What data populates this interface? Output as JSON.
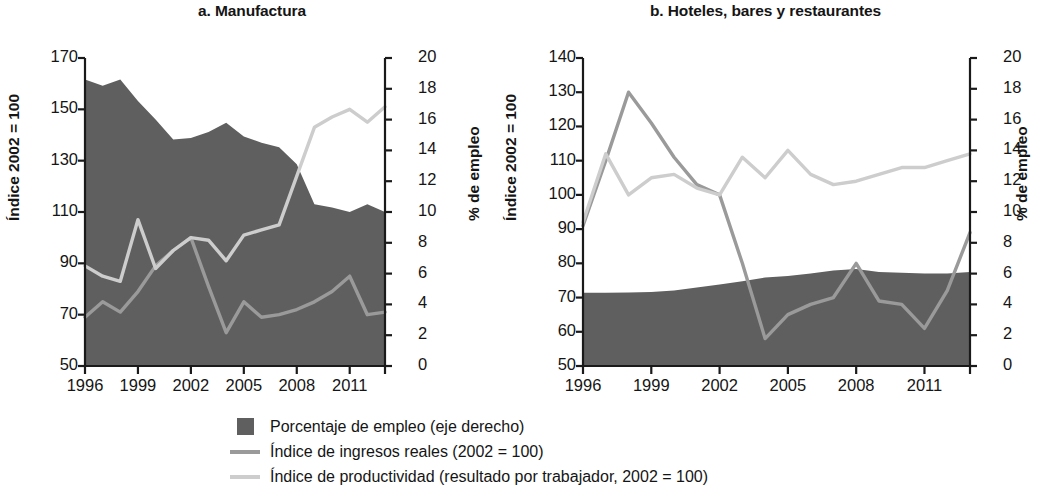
{
  "figure": {
    "panels": [
      {
        "id": "a",
        "title": "a. Manufactura",
        "y_left_label": "Índice 2002 = 100",
        "y_right_label": "% de empleo"
      },
      {
        "id": "b",
        "title": "b. Hoteles, bares y restaurantes",
        "y_left_label": "Índice 2002 = 100",
        "y_right_label": "% de empleo"
      }
    ]
  },
  "legend": {
    "items": [
      {
        "key": "area",
        "symbol": "filled-square",
        "color": "#5f5f5f",
        "label": "Porcentaje de empleo (eje derecho)"
      },
      {
        "key": "income",
        "symbol": "line",
        "color": "#9a9a9a",
        "label": "Índice de ingresos reales (2002 = 100)"
      },
      {
        "key": "prod",
        "symbol": "line",
        "color": "#cdcdcd",
        "label": "Índice de productividad (resultado por trabajador, 2002 = 100)"
      }
    ]
  },
  "chart_data": [
    {
      "id": "a",
      "type": "area",
      "title": "a. Manufactura",
      "xlabel": "",
      "ylabel": "Índice 2002 = 100",
      "y2label": "% de empleo",
      "grid": false,
      "legend_position": "bottom",
      "x": [
        1996,
        1997,
        1998,
        1999,
        2000,
        2001,
        2002,
        2003,
        2004,
        2005,
        2006,
        2007,
        2008,
        2009,
        2010,
        2011,
        2012,
        2013
      ],
      "xticks": [
        1996,
        1999,
        2002,
        2005,
        2008,
        2011
      ],
      "xlim": [
        1996,
        2013
      ],
      "ylim": [
        50,
        170
      ],
      "yticks": [
        50,
        70,
        90,
        110,
        130,
        150,
        170
      ],
      "y2lim": [
        0,
        20
      ],
      "y2ticks": [
        0,
        2,
        4,
        6,
        8,
        10,
        12,
        14,
        16,
        18,
        20
      ],
      "series": [
        {
          "name": "Porcentaje de empleo (eje derecho)",
          "axis": "right",
          "kind": "area",
          "color": "#5f5f5f",
          "values": [
            18.6,
            18.2,
            18.6,
            17.2,
            16.0,
            14.7,
            14.8,
            15.2,
            15.8,
            14.9,
            14.5,
            14.2,
            13.1,
            10.5,
            10.3,
            10.0,
            10.5,
            10.0
          ]
        },
        {
          "name": "Índice de ingresos reales (2002 = 100)",
          "axis": "left",
          "kind": "line",
          "color": "#9a9a9a",
          "values": [
            69,
            75,
            71,
            79,
            89,
            95,
            100,
            81,
            63,
            75,
            69,
            70,
            72,
            75,
            79,
            85,
            70,
            71
          ]
        },
        {
          "name": "Índice de productividad (resultado por trabajador, 2002 = 100)",
          "axis": "left",
          "kind": "line",
          "color": "#cdcdcd",
          "values": [
            89,
            85,
            83,
            107,
            88,
            95,
            100,
            99,
            91,
            101,
            103,
            105,
            124,
            143,
            147,
            150,
            145,
            151
          ]
        }
      ]
    },
    {
      "id": "b",
      "type": "area",
      "title": "b. Hoteles, bares y restaurantes",
      "xlabel": "",
      "ylabel": "Índice 2002 = 100",
      "y2label": "% de empleo",
      "grid": false,
      "legend_position": "bottom",
      "x": [
        1996,
        1997,
        1998,
        1999,
        2000,
        2001,
        2002,
        2003,
        2004,
        2005,
        2006,
        2007,
        2008,
        2009,
        2010,
        2011,
        2012,
        2013
      ],
      "xticks": [
        1996,
        1999,
        2002,
        2005,
        2008,
        2011
      ],
      "xlim": [
        1996,
        2013
      ],
      "ylim": [
        50,
        140
      ],
      "yticks": [
        50,
        60,
        70,
        80,
        90,
        100,
        110,
        120,
        130,
        140
      ],
      "y2lim": [
        0,
        20
      ],
      "y2ticks": [
        0,
        2,
        4,
        6,
        8,
        10,
        12,
        14,
        16,
        18,
        20
      ],
      "series": [
        {
          "name": "Porcentaje de empleo (eje derecho)",
          "axis": "right",
          "kind": "area",
          "color": "#5f5f5f",
          "values": [
            4.75,
            4.75,
            4.78,
            4.8,
            4.9,
            5.1,
            5.3,
            5.5,
            5.75,
            5.85,
            6.0,
            6.2,
            6.3,
            6.1,
            6.05,
            6.0,
            6.0,
            6.1
          ]
        },
        {
          "name": "Índice de ingresos reales (2002 = 100)",
          "axis": "left",
          "kind": "line",
          "color": "#9a9a9a",
          "values": [
            91,
            110,
            130,
            121,
            111,
            103,
            100,
            80,
            58,
            65,
            68,
            70,
            80,
            69,
            68,
            61,
            72,
            89
          ]
        },
        {
          "name": "Índice de productividad (resultado por trabajador, 2002 = 100)",
          "axis": "left",
          "kind": "line",
          "color": "#cdcdcd",
          "values": [
            92,
            112,
            100,
            105,
            106,
            102,
            100,
            111,
            105,
            113,
            106,
            103,
            104,
            106,
            108,
            108,
            110,
            112
          ]
        }
      ]
    }
  ]
}
